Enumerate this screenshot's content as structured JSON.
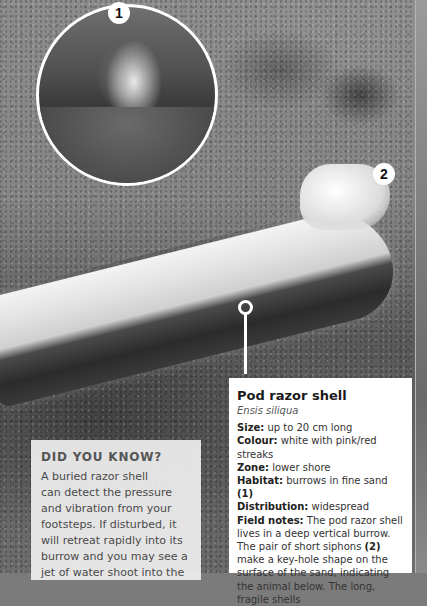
{
  "photo": {
    "subject": "razor-shell-on-sand",
    "markers": [
      {
        "id": "marker_1",
        "label": "1"
      },
      {
        "id": "marker_2",
        "label": "2"
      }
    ]
  },
  "info": {
    "title": "Pod razor shell",
    "latin": "Ensis siliqua",
    "rows": [
      {
        "key": "Size:",
        "value": " up to 20 cm long"
      },
      {
        "key": "Colour:",
        "value": " white with pink/red streaks"
      },
      {
        "key": "Zone:",
        "value": " lower shore"
      },
      {
        "key": "Habitat:",
        "value": " burrows in fine sand ",
        "ref": "(1)"
      },
      {
        "key": "Distribution:",
        "value": " widespread"
      },
      {
        "key": "Field notes:",
        "value": " The pod razor shell lives in a deep vertical burrow. The pair of short siphons ",
        "ref": "(2)",
        "value2": " make a key-hole shape on the surface of the sand, indicating the animal below. The long, fragile shells"
      }
    ]
  },
  "did_you_know": {
    "title": "DID YOU KNOW?",
    "lines": [
      "A buried razor shell",
      "can detect the pressure",
      "and vibration from your",
      "footsteps. If disturbed, it",
      "will retreat rapidly into its",
      "burrow and you may see a",
      "jet of water shoot into the"
    ]
  }
}
